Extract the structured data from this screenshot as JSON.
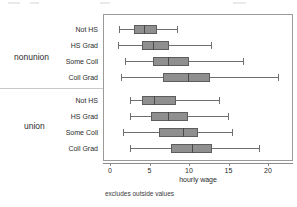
{
  "chart_data": {
    "type": "box",
    "title": "",
    "xlabel": "hourly wage",
    "ylabel": "",
    "note": "excludes outside values",
    "xlim": [
      -0.6,
      23.0
    ],
    "xticks": [
      0,
      5,
      10,
      15,
      20
    ],
    "xtick_labels": [
      "0",
      "5",
      "10",
      "15",
      "20"
    ],
    "grid": false,
    "legend": "none",
    "orientation": "horizontal",
    "groups": [
      {
        "name": "nonunion",
        "label": "nonunion",
        "boxes": [
          {
            "category": "Not HS",
            "whisker_low": 1.1,
            "q1": 3.0,
            "median": 4.3,
            "q3": 5.9,
            "whisker_high": 8.5
          },
          {
            "category": "HS Grad",
            "whisker_low": 1.0,
            "q1": 4.1,
            "median": 5.5,
            "q3": 7.5,
            "whisker_high": 12.8
          },
          {
            "category": "Some Coll",
            "whisker_low": 1.9,
            "q1": 5.5,
            "median": 7.3,
            "q3": 10.0,
            "whisker_high": 16.8
          },
          {
            "category": "Coll Grad",
            "whisker_low": 1.4,
            "q1": 6.7,
            "median": 9.9,
            "q3": 12.7,
            "whisker_high": 21.3
          }
        ]
      },
      {
        "name": "union",
        "label": "union",
        "boxes": [
          {
            "category": "Not HS",
            "whisker_low": 2.5,
            "q1": 4.1,
            "median": 5.6,
            "q3": 8.4,
            "whisker_high": 13.8
          },
          {
            "category": "HS Grad",
            "whisker_low": 2.5,
            "q1": 5.2,
            "median": 7.3,
            "q3": 9.9,
            "whisker_high": 14.9
          },
          {
            "category": "Some Coll",
            "whisker_low": 1.7,
            "q1": 6.2,
            "median": 9.2,
            "q3": 11.1,
            "whisker_high": 15.4
          },
          {
            "category": "Coll Grad",
            "whisker_low": 2.5,
            "q1": 7.7,
            "median": 10.4,
            "q3": 12.9,
            "whisker_high": 18.9
          }
        ]
      }
    ],
    "colors": {
      "box_fill": "#8f8f8f",
      "box_border": "#5d5d5d",
      "median": "#4a4a4a",
      "whisker": "#6e6e6e",
      "frame": "#9a9a9a",
      "text": "#2b2b2b",
      "background": "#ffffff"
    }
  }
}
